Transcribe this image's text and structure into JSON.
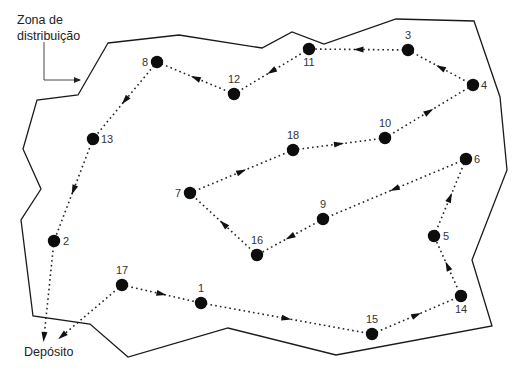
{
  "labels": {
    "zone_line1": "Zona de",
    "zone_line2": "distribuição",
    "depot": "Depósito"
  },
  "colors": {
    "line": "#1a1a1a",
    "node": "#0d0d0d",
    "text": "#333333",
    "background": "#ffffff"
  },
  "boundary": [
    [
      108,
      43
    ],
    [
      179,
      35
    ],
    [
      262,
      48
    ],
    [
      292,
      32
    ],
    [
      324,
      44
    ],
    [
      396,
      19
    ],
    [
      474,
      21
    ],
    [
      500,
      97
    ],
    [
      507,
      170
    ],
    [
      472,
      260
    ],
    [
      492,
      326
    ],
    [
      336,
      355
    ],
    [
      228,
      328
    ],
    [
      128,
      357
    ],
    [
      90,
      324
    ],
    [
      33,
      316
    ],
    [
      21,
      220
    ],
    [
      41,
      189
    ],
    [
      23,
      149
    ],
    [
      37,
      100
    ],
    [
      78,
      95
    ]
  ],
  "nodes": [
    {
      "id": "1",
      "x": 201,
      "y": 303,
      "lx": 201,
      "ly": 292,
      "anchor": "middle"
    },
    {
      "id": "2",
      "x": 54,
      "y": 241,
      "lx": 63,
      "ly": 245,
      "anchor": "start"
    },
    {
      "id": "3",
      "x": 408,
      "y": 50,
      "lx": 408,
      "ly": 39,
      "anchor": "middle"
    },
    {
      "id": "4",
      "x": 473,
      "y": 85,
      "lx": 481,
      "ly": 89,
      "anchor": "start"
    },
    {
      "id": "5",
      "x": 434,
      "y": 236,
      "lx": 443,
      "ly": 240,
      "anchor": "start"
    },
    {
      "id": "6",
      "x": 466,
      "y": 159,
      "lx": 474,
      "ly": 163,
      "anchor": "start"
    },
    {
      "id": "7",
      "x": 190,
      "y": 193,
      "lx": 181,
      "ly": 197,
      "anchor": "end"
    },
    {
      "id": "8",
      "x": 157,
      "y": 62,
      "lx": 148,
      "ly": 66,
      "anchor": "end"
    },
    {
      "id": "9",
      "x": 323,
      "y": 219,
      "lx": 323,
      "ly": 208,
      "anchor": "middle"
    },
    {
      "id": "10",
      "x": 385,
      "y": 138,
      "lx": 385,
      "ly": 127,
      "anchor": "middle"
    },
    {
      "id": "11",
      "x": 309,
      "y": 49,
      "lx": 309,
      "ly": 66,
      "anchor": "middle"
    },
    {
      "id": "12",
      "x": 234,
      "y": 94,
      "lx": 234,
      "ly": 83,
      "anchor": "middle"
    },
    {
      "id": "13",
      "x": 93,
      "y": 139,
      "lx": 101,
      "ly": 143,
      "anchor": "start"
    },
    {
      "id": "14",
      "x": 461,
      "y": 296,
      "lx": 461,
      "ly": 313,
      "anchor": "middle"
    },
    {
      "id": "15",
      "x": 372,
      "y": 334,
      "lx": 372,
      "ly": 323,
      "anchor": "middle"
    },
    {
      "id": "16",
      "x": 257,
      "y": 255,
      "lx": 257,
      "ly": 244,
      "anchor": "middle"
    },
    {
      "id": "17",
      "x": 122,
      "y": 285,
      "lx": 122,
      "ly": 274,
      "anchor": "middle"
    },
    {
      "id": "18",
      "x": 293,
      "y": 150,
      "lx": 293,
      "ly": 139,
      "anchor": "middle"
    }
  ],
  "route_order": [
    "17",
    "1",
    "15",
    "14",
    "5",
    "6",
    "9",
    "16",
    "7",
    "18",
    "10",
    "4",
    "3",
    "11",
    "12",
    "8",
    "13",
    "2"
  ],
  "depot_point": {
    "x": 46,
    "y": 335
  },
  "depot_entry_from_17": {
    "x": 62,
    "y": 336
  },
  "depot_entry_from_2": {
    "x": 44,
    "y": 337
  },
  "zone_pointer": [
    [
      44,
      42
    ],
    [
      44,
      80
    ],
    [
      80,
      80
    ]
  ]
}
